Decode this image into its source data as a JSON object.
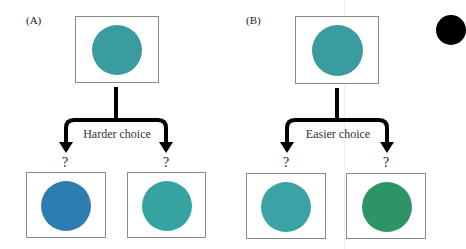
{
  "figure": {
    "panels": [
      {
        "id": "A",
        "label": "(A)",
        "choice_label": "Harder choice",
        "sample": {
          "color": "#3a9c9e"
        },
        "options": [
          {
            "mark": "?",
            "color": "#2e7db0"
          },
          {
            "mark": "?",
            "color": "#35a4a0"
          }
        ]
      },
      {
        "id": "B",
        "label": "(B)",
        "choice_label": "Easier choice",
        "sample": {
          "color": "#3a9c9e"
        },
        "options": [
          {
            "mark": "?",
            "color": "#3aa3a6"
          },
          {
            "mark": "?",
            "color": "#2e9468"
          }
        ]
      }
    ],
    "colors": {
      "arrow": "#000000",
      "box_border": "#8a8a8a",
      "corner_dot": "#000000"
    }
  }
}
